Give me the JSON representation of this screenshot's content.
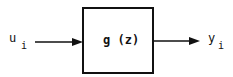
{
  "diagram": {
    "type": "block-diagram",
    "input": {
      "symbol": "u",
      "subscript": "i"
    },
    "block": {
      "label": "g (z)"
    },
    "output": {
      "symbol": "y",
      "subscript": "i"
    },
    "colors": {
      "stroke": "#111111",
      "background": "#ffffff"
    }
  }
}
